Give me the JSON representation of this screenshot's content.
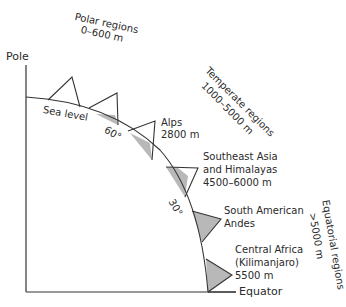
{
  "diagram": {
    "axes": {
      "pole_label": "Pole",
      "equator_label": "Equator",
      "sea_level_label": "Sea level"
    },
    "latitude_marks": [
      {
        "label": "60°"
      },
      {
        "label": "30°"
      }
    ],
    "regions": [
      {
        "name": "Polar regions",
        "range": "0–600 m"
      },
      {
        "name": "Temperate regions",
        "range": "1000–5000 m"
      },
      {
        "name": "Equatorial regions",
        "range": ">5000 m"
      }
    ],
    "mountains": [
      {
        "name": "",
        "altitude": "",
        "snow_fraction": 1.0
      },
      {
        "name": "",
        "altitude": "",
        "snow_fraction": 0.9
      },
      {
        "name": "Alps",
        "altitude": "2800 m",
        "snow_fraction": 0.8
      },
      {
        "name": "Southeast Asia and Himalayas",
        "line1": "Southeast Asia",
        "line2": "and Himalayas",
        "altitude": "4500–6000 m",
        "snow_fraction": 0.5
      },
      {
        "name": "South American Andes",
        "line1": "South American",
        "line2": "Andes",
        "altitude": "",
        "snow_fraction": 0.2
      },
      {
        "name": "Central Africa (Kilimanjaro)",
        "line1": "Central Africa",
        "line2": "(Kilimanjaro)",
        "altitude": "5500 m",
        "snow_fraction": 0.1
      }
    ],
    "colors": {
      "line": "#333333",
      "shade": "#b8b8b8",
      "background": "#ffffff"
    }
  }
}
